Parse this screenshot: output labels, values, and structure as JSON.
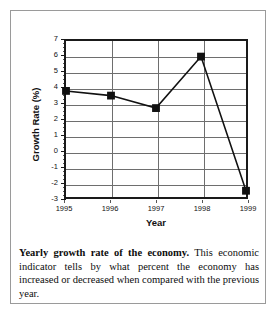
{
  "figure": {
    "caption_lead": "Yearly growth rate of the economy.",
    "caption_body": " This economic indicator tells by what percent the economy has increased or decreased when compared with the previous year."
  },
  "chart_data": {
    "type": "line",
    "title": "",
    "xlabel": "Year",
    "ylabel": "Growth Rate (%)",
    "categories": [
      "1995",
      "1996",
      "1997",
      "1998",
      "1999"
    ],
    "values": [
      3.8,
      3.5,
      2.7,
      6.0,
      -2.6
    ],
    "series": [
      {
        "name": "Growth Rate",
        "values": [
          3.8,
          3.5,
          2.7,
          6.0,
          -2.6
        ]
      }
    ],
    "ylim": [
      -3,
      7
    ],
    "ytick_labels": [
      "7",
      "6",
      "5",
      "4",
      "3",
      "2",
      "1",
      "0",
      "-1",
      "-2",
      "-3"
    ],
    "ytick_values": [
      7,
      6,
      5,
      4,
      3,
      2,
      1,
      0,
      -1,
      -2,
      -3
    ],
    "xtick_labels": [
      "1995",
      "1996",
      "1997",
      "1998",
      "1999"
    ],
    "grid": "horizontal-and-vertical",
    "legend": "none",
    "marker": "square",
    "line_color": "#111111",
    "marker_color": "#111111",
    "grid_color": "#6e6e6e",
    "axis_color": "#1a1a1a"
  }
}
